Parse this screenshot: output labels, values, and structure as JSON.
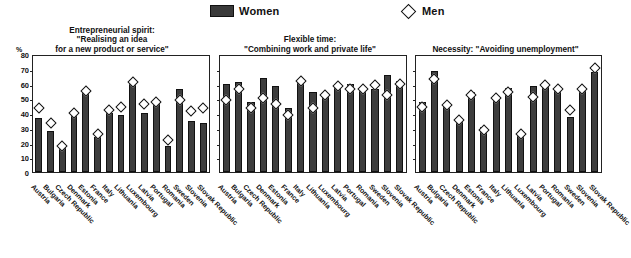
{
  "legend": {
    "women_label": "Women",
    "men_label": "Men",
    "women_color": "#3d3d3d",
    "men_color": "#ffffff"
  },
  "axis": {
    "unit": "%",
    "ticks": [
      80,
      70,
      60,
      50,
      40,
      30,
      20,
      10,
      0
    ],
    "ylim": [
      0,
      80
    ]
  },
  "chart_data": [
    {
      "type": "bar",
      "title": "Entrepreneurial spirit:\n\"Realising an idea\nfor a new product or service\"",
      "xlabel": "",
      "ylabel": "%",
      "ylim": [
        0,
        80
      ],
      "grid": false,
      "legend_position": "top",
      "categories": [
        "Austria",
        "Bulgaria",
        "Czech Republic",
        "Denmark",
        "Estonia",
        "France",
        "Italy",
        "Lithuania",
        "Luxembourg",
        "Latvia",
        "Portugal",
        "Romania",
        "Sweden",
        "Slovenia",
        "Slovak Republic"
      ],
      "series": [
        {
          "name": "Women",
          "values": [
            37,
            28,
            18,
            41,
            56,
            24,
            41,
            39,
            62,
            41,
            47,
            18,
            57,
            35,
            34
          ]
        },
        {
          "name": "Men",
          "values": [
            44,
            34,
            18,
            41,
            56,
            26,
            43,
            45,
            62,
            47,
            48,
            22,
            50,
            42,
            44
          ]
        }
      ]
    },
    {
      "type": "bar",
      "title": "Flexible time:\n\"Combining work and private life\"",
      "xlabel": "",
      "ylabel": "",
      "ylim": [
        0,
        80
      ],
      "grid": false,
      "legend_position": "top",
      "categories": [
        "Austria",
        "Bulgaria",
        "Czech Republic",
        "Denmark",
        "Estonia",
        "France",
        "Italy",
        "Lithuania",
        "Luxembourg",
        "Latvia",
        "Portugal",
        "Romania",
        "Sweden",
        "Slovenia",
        "Slovak Republic"
      ],
      "series": [
        {
          "name": "Women",
          "values": [
            61,
            62,
            48,
            65,
            59,
            44,
            63,
            55,
            52,
            60,
            61,
            58,
            57,
            67,
            63
          ]
        },
        {
          "name": "Men",
          "values": [
            50,
            57,
            44,
            51,
            47,
            39,
            63,
            44,
            53,
            59,
            57,
            57,
            60,
            53,
            61
          ]
        }
      ]
    },
    {
      "type": "bar",
      "title": "Necessity: \"Avoiding unemployment\"",
      "xlabel": "",
      "ylabel": "",
      "ylim": [
        0,
        80
      ],
      "grid": false,
      "legend_position": "top",
      "categories": [
        "Austria",
        "Bulgaria",
        "Czech Republic",
        "Denmark",
        "Estonia",
        "France",
        "Italy",
        "Lithuania",
        "Luxembourg",
        "Latvia",
        "Portugal",
        "Romania",
        "Sweden",
        "Slovenia",
        "Slovak Republic"
      ],
      "series": [
        {
          "name": "Women",
          "values": [
            48,
            70,
            47,
            37,
            55,
            31,
            52,
            58,
            27,
            59,
            61,
            56,
            38,
            58,
            69
          ]
        },
        {
          "name": "Men",
          "values": [
            45,
            64,
            46,
            36,
            53,
            29,
            51,
            55,
            26,
            52,
            60,
            57,
            43,
            57,
            72
          ]
        }
      ]
    }
  ]
}
